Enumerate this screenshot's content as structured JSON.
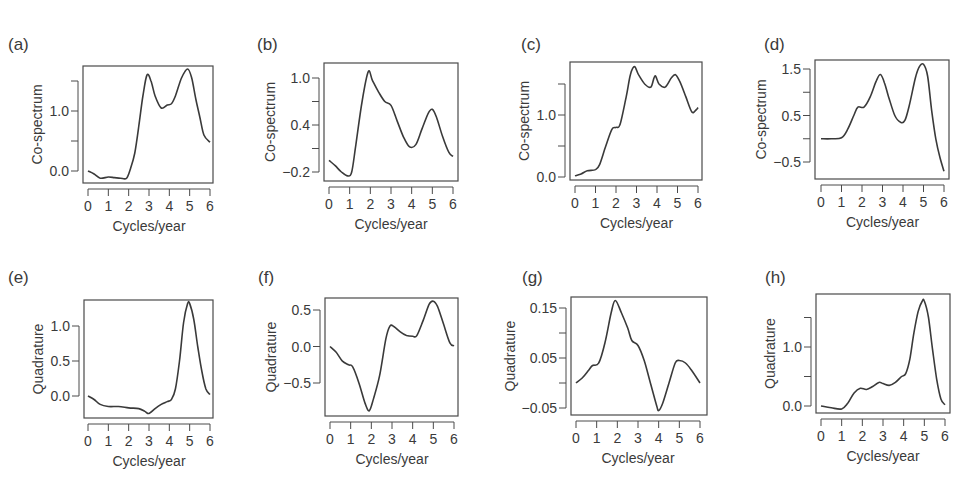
{
  "chart_data": [
    {
      "panel": "(a)",
      "type": "line",
      "xlabel": "Cycles/year",
      "ylabel": "Co-spectrum",
      "xticks": [
        0,
        1,
        2,
        3,
        4,
        5,
        6
      ],
      "yticks": [
        0.0,
        0.5,
        1.0,
        1.5
      ],
      "ytick_labels": [
        "0.0",
        "",
        "1.0",
        ""
      ],
      "xlim": [
        0,
        6
      ],
      "ylim": [
        -0.2,
        1.8
      ],
      "x": [
        0,
        0.3,
        0.6,
        1.0,
        1.3,
        1.6,
        1.9,
        2.1,
        2.3,
        2.5,
        2.7,
        2.9,
        3.1,
        3.3,
        3.6,
        3.9,
        4.1,
        4.3,
        4.6,
        4.9,
        5.1,
        5.3,
        5.5,
        5.7,
        6.0
      ],
      "y": [
        0.0,
        -0.05,
        -0.12,
        -0.1,
        -0.11,
        -0.12,
        -0.12,
        0.05,
        0.3,
        0.75,
        1.25,
        1.6,
        1.5,
        1.25,
        1.05,
        1.1,
        1.12,
        1.25,
        1.55,
        1.7,
        1.55,
        1.2,
        0.9,
        0.6,
        0.48
      ]
    },
    {
      "panel": "(b)",
      "type": "line",
      "xlabel": "Cycles/year",
      "ylabel": "Co-spectrum",
      "xticks": [
        0,
        1,
        2,
        3,
        4,
        5,
        6
      ],
      "yticks": [
        -0.2,
        0.1,
        0.4,
        0.7,
        1.0
      ],
      "ytick_labels": [
        "−0.2",
        "",
        "0.4",
        "",
        "1.0"
      ],
      "xlim": [
        0,
        6
      ],
      "ylim": [
        -0.32,
        1.2
      ],
      "x": [
        0,
        0.3,
        0.6,
        0.9,
        1.1,
        1.3,
        1.6,
        1.9,
        2.1,
        2.4,
        2.7,
        3.0,
        3.3,
        3.6,
        3.9,
        4.2,
        4.5,
        4.8,
        5.0,
        5.2,
        5.5,
        5.8,
        6.0
      ],
      "y": [
        -0.05,
        -0.12,
        -0.2,
        -0.25,
        -0.2,
        0.15,
        0.7,
        1.08,
        0.97,
        0.82,
        0.7,
        0.65,
        0.45,
        0.25,
        0.12,
        0.15,
        0.35,
        0.55,
        0.6,
        0.5,
        0.25,
        0.05,
        0.0
      ]
    },
    {
      "panel": "(c)",
      "type": "line",
      "xlabel": "Cycles/year",
      "ylabel": "Co-spectrum",
      "xticks": [
        0,
        1,
        2,
        3,
        4,
        5,
        6
      ],
      "yticks": [
        0.0,
        0.5,
        1.0,
        1.5
      ],
      "ytick_labels": [
        "0.0",
        "",
        "1.0",
        ""
      ],
      "xlim": [
        0,
        6
      ],
      "ylim": [
        -0.05,
        1.85
      ],
      "x": [
        0,
        0.3,
        0.6,
        1.0,
        1.2,
        1.5,
        1.8,
        2.0,
        2.2,
        2.5,
        2.7,
        2.9,
        3.1,
        3.4,
        3.7,
        3.9,
        4.1,
        4.4,
        4.7,
        4.9,
        5.1,
        5.4,
        5.7,
        5.9,
        6.0
      ],
      "y": [
        0.02,
        0.05,
        0.1,
        0.12,
        0.2,
        0.5,
        0.77,
        0.8,
        0.85,
        1.3,
        1.65,
        1.78,
        1.65,
        1.5,
        1.45,
        1.63,
        1.5,
        1.45,
        1.6,
        1.65,
        1.55,
        1.3,
        1.05,
        1.08,
        1.12
      ]
    },
    {
      "panel": "(d)",
      "type": "line",
      "xlabel": "Cycles/year",
      "ylabel": "Co-spectrum",
      "xticks": [
        0,
        1,
        2,
        3,
        4,
        5,
        6
      ],
      "yticks": [
        -0.5,
        0.0,
        0.5,
        1.0,
        1.5
      ],
      "ytick_labels": [
        "−0.5",
        "",
        "0.5",
        "",
        "1.5"
      ],
      "xlim": [
        0,
        6
      ],
      "ylim": [
        -0.75,
        1.8
      ],
      "x": [
        0,
        0.5,
        1.0,
        1.3,
        1.6,
        1.8,
        2.1,
        2.4,
        2.7,
        2.9,
        3.1,
        3.3,
        3.6,
        3.9,
        4.1,
        4.3,
        4.6,
        4.8,
        5.0,
        5.2,
        5.4,
        5.6,
        5.8,
        6.0
      ],
      "y": [
        0.0,
        0.0,
        0.02,
        0.2,
        0.5,
        0.68,
        0.68,
        0.9,
        1.25,
        1.38,
        1.2,
        0.9,
        0.5,
        0.35,
        0.4,
        0.7,
        1.3,
        1.55,
        1.6,
        1.35,
        0.6,
        0.0,
        -0.4,
        -0.7
      ]
    },
    {
      "panel": "(e)",
      "type": "line",
      "xlabel": "Cycles/year",
      "ylabel": "Quadrature",
      "xticks": [
        0,
        1,
        2,
        3,
        4,
        5,
        6
      ],
      "yticks": [
        0.0,
        0.5,
        1.0
      ],
      "ytick_labels": [
        "0.0",
        "0.5",
        "1.0"
      ],
      "xlim": [
        0,
        6
      ],
      "ylim": [
        -0.3,
        1.4
      ],
      "x": [
        0,
        0.3,
        0.6,
        1.0,
        1.5,
        2.0,
        2.5,
        2.8,
        3.0,
        3.3,
        3.6,
        3.9,
        4.1,
        4.3,
        4.5,
        4.7,
        4.9,
        5.0,
        5.2,
        5.4,
        5.6,
        5.8,
        6.0
      ],
      "y": [
        0.0,
        -0.05,
        -0.12,
        -0.15,
        -0.15,
        -0.17,
        -0.18,
        -0.22,
        -0.25,
        -0.18,
        -0.12,
        -0.08,
        -0.05,
        0.1,
        0.5,
        1.05,
        1.32,
        1.32,
        1.1,
        0.7,
        0.35,
        0.1,
        0.02
      ]
    },
    {
      "panel": "(f)",
      "type": "line",
      "xlabel": "Cycles/year",
      "ylabel": "Quadrature",
      "xticks": [
        0,
        1,
        2,
        3,
        4,
        5,
        6
      ],
      "yticks": [
        -0.5,
        0.0,
        0.5
      ],
      "ytick_labels": [
        "−0.5",
        "0.0",
        "0.5"
      ],
      "xlim": [
        0,
        6
      ],
      "ylim": [
        -0.95,
        0.7
      ],
      "x": [
        0,
        0.3,
        0.6,
        0.9,
        1.1,
        1.4,
        1.7,
        1.9,
        2.1,
        2.4,
        2.7,
        2.9,
        3.1,
        3.4,
        3.7,
        4.0,
        4.2,
        4.5,
        4.8,
        5.0,
        5.2,
        5.5,
        5.8,
        6.0
      ],
      "y": [
        0.0,
        -0.08,
        -0.2,
        -0.25,
        -0.28,
        -0.5,
        -0.78,
        -0.88,
        -0.72,
        -0.4,
        0.1,
        0.28,
        0.27,
        0.2,
        0.15,
        0.14,
        0.15,
        0.35,
        0.58,
        0.62,
        0.55,
        0.3,
        0.05,
        0.01
      ]
    },
    {
      "panel": "(g)",
      "type": "line",
      "xlabel": "Cycles/year",
      "ylabel": "Quadrature",
      "xticks": [
        0,
        1,
        2,
        3,
        4,
        5,
        6
      ],
      "yticks": [
        -0.05,
        0.0,
        0.05,
        0.1,
        0.15
      ],
      "ytick_labels": [
        "−0.05",
        "",
        "0.05",
        "",
        "0.15"
      ],
      "xlim": [
        0,
        6
      ],
      "ylim": [
        -0.06,
        0.175
      ],
      "x": [
        0,
        0.3,
        0.6,
        0.8,
        1.1,
        1.4,
        1.7,
        1.9,
        2.2,
        2.5,
        2.7,
        3.0,
        3.3,
        3.6,
        3.9,
        4.0,
        4.2,
        4.5,
        4.8,
        5.0,
        5.3,
        5.6,
        6.0
      ],
      "y": [
        0.0,
        0.01,
        0.025,
        0.035,
        0.04,
        0.08,
        0.14,
        0.165,
        0.14,
        0.11,
        0.085,
        0.075,
        0.045,
        0.0,
        -0.045,
        -0.055,
        -0.04,
        0.0,
        0.04,
        0.045,
        0.04,
        0.025,
        0.0
      ]
    },
    {
      "panel": "(h)",
      "type": "line",
      "xlabel": "Cycles/year",
      "ylabel": "Quadrature",
      "xticks": [
        0,
        1,
        2,
        3,
        4,
        5,
        6
      ],
      "yticks": [
        0.0,
        0.5,
        1.0,
        1.5
      ],
      "ytick_labels": [
        "0.0",
        "",
        "1.0",
        ""
      ],
      "xlim": [
        0,
        6
      ],
      "ylim": [
        -0.12,
        1.9
      ],
      "x": [
        0,
        0.5,
        1.0,
        1.3,
        1.6,
        1.9,
        2.2,
        2.5,
        2.8,
        3.0,
        3.3,
        3.6,
        3.9,
        4.1,
        4.3,
        4.5,
        4.7,
        4.9,
        5.0,
        5.2,
        5.4,
        5.6,
        5.8,
        6.0
      ],
      "y": [
        0.0,
        -0.03,
        -0.05,
        0.05,
        0.22,
        0.3,
        0.28,
        0.33,
        0.4,
        0.38,
        0.35,
        0.4,
        0.5,
        0.55,
        0.8,
        1.25,
        1.6,
        1.78,
        1.78,
        1.5,
        0.95,
        0.45,
        0.12,
        0.02
      ]
    }
  ],
  "panels": [
    {
      "tag": "(a)",
      "box": [
        83,
        66,
        213,
        183
      ],
      "xpx": [
        88,
        210
      ],
      "ycal": [
        [
          0.0,
          171
        ],
        [
          1.0,
          111
        ]
      ]
    },
    {
      "tag": "(b)",
      "box": [
        324,
        63,
        458,
        181
      ],
      "xpx": [
        329,
        453
      ],
      "ycal": [
        [
          -0.2,
          172
        ],
        [
          1.0,
          78
        ]
      ]
    },
    {
      "tag": "(c)",
      "box": [
        570,
        62,
        702,
        180
      ],
      "xpx": [
        575,
        698
      ],
      "ycal": [
        [
          0.0,
          177
        ],
        [
          1.0,
          115
        ]
      ]
    },
    {
      "tag": "(d)",
      "box": [
        815,
        60,
        949,
        179
      ],
      "xpx": [
        821,
        944
      ],
      "ycal": [
        [
          -0.5,
          162
        ],
        [
          1.5,
          69
        ]
      ]
    },
    {
      "tag": "(e)",
      "box": [
        84,
        300,
        213,
        418
      ],
      "xpx": [
        88,
        210
      ],
      "ycal": [
        [
          0.0,
          396
        ],
        [
          1.0,
          326
        ]
      ]
    },
    {
      "tag": "(f)",
      "box": [
        325,
        298,
        458,
        416
      ],
      "xpx": [
        330,
        454
      ],
      "ycal": [
        [
          -0.5,
          383
        ],
        [
          0.5,
          310
        ]
      ]
    },
    {
      "tag": "(g)",
      "box": [
        571,
        297,
        707,
        415
      ],
      "xpx": [
        576,
        700
      ],
      "ycal": [
        [
          -0.05,
          408
        ],
        [
          0.15,
          308
        ]
      ]
    },
    {
      "tag": "(h)",
      "box": [
        816,
        294,
        950,
        413
      ],
      "xpx": [
        821,
        945
      ],
      "ycal": [
        [
          0.0,
          406
        ],
        [
          1.0,
          347
        ]
      ]
    }
  ],
  "style": {
    "line_color": "#3a3a3a",
    "axis_color": "#4a4a4a",
    "background": "#ffffff"
  }
}
